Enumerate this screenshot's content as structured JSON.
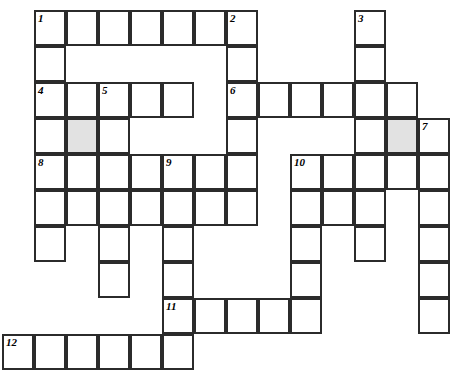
{
  "puzzle": {
    "type": "crossword-grid",
    "title": "Crossword Puzzle Grid",
    "columns": 14,
    "rows": 10,
    "cell_width": 32,
    "cell_height": 36,
    "origin_x": 2,
    "origin_y": 10,
    "colors": {
      "background": "#ffffff",
      "cell_fill": "#ffffff",
      "cell_border": "#2b2b2b",
      "shaded_fill": "#e2e2e2",
      "number_text": "#000000"
    },
    "clue_numbers": [
      1,
      2,
      3,
      4,
      5,
      6,
      7,
      8,
      9,
      10,
      11,
      12
    ],
    "cells": [
      {
        "col": 1,
        "row": 0,
        "number": "1",
        "shaded": false,
        "letter": ""
      },
      {
        "col": 2,
        "row": 0,
        "number": "",
        "shaded": false,
        "letter": ""
      },
      {
        "col": 3,
        "row": 0,
        "number": "",
        "shaded": false,
        "letter": ""
      },
      {
        "col": 4,
        "row": 0,
        "number": "",
        "shaded": false,
        "letter": ""
      },
      {
        "col": 5,
        "row": 0,
        "number": "",
        "shaded": false,
        "letter": ""
      },
      {
        "col": 6,
        "row": 0,
        "number": "",
        "shaded": false,
        "letter": ""
      },
      {
        "col": 7,
        "row": 0,
        "number": "2",
        "shaded": false,
        "letter": ""
      },
      {
        "col": 11,
        "row": 0,
        "number": "3",
        "shaded": false,
        "letter": ""
      },
      {
        "col": 1,
        "row": 1,
        "number": "",
        "shaded": false,
        "letter": ""
      },
      {
        "col": 7,
        "row": 1,
        "number": "",
        "shaded": false,
        "letter": ""
      },
      {
        "col": 11,
        "row": 1,
        "number": "",
        "shaded": false,
        "letter": ""
      },
      {
        "col": 1,
        "row": 2,
        "number": "4",
        "shaded": false,
        "letter": ""
      },
      {
        "col": 2,
        "row": 2,
        "number": "",
        "shaded": false,
        "letter": ""
      },
      {
        "col": 3,
        "row": 2,
        "number": "5",
        "shaded": false,
        "letter": ""
      },
      {
        "col": 4,
        "row": 2,
        "number": "",
        "shaded": false,
        "letter": ""
      },
      {
        "col": 5,
        "row": 2,
        "number": "",
        "shaded": false,
        "letter": ""
      },
      {
        "col": 7,
        "row": 2,
        "number": "6",
        "shaded": false,
        "letter": ""
      },
      {
        "col": 8,
        "row": 2,
        "number": "",
        "shaded": false,
        "letter": ""
      },
      {
        "col": 9,
        "row": 2,
        "number": "",
        "shaded": false,
        "letter": ""
      },
      {
        "col": 10,
        "row": 2,
        "number": "",
        "shaded": false,
        "letter": ""
      },
      {
        "col": 11,
        "row": 2,
        "number": "",
        "shaded": false,
        "letter": ""
      },
      {
        "col": 12,
        "row": 2,
        "number": "",
        "shaded": false,
        "letter": ""
      },
      {
        "col": 1,
        "row": 3,
        "number": "",
        "shaded": false,
        "letter": ""
      },
      {
        "col": 2,
        "row": 3,
        "number": "",
        "shaded": true,
        "letter": ""
      },
      {
        "col": 3,
        "row": 3,
        "number": "",
        "shaded": false,
        "letter": ""
      },
      {
        "col": 7,
        "row": 3,
        "number": "",
        "shaded": false,
        "letter": ""
      },
      {
        "col": 11,
        "row": 3,
        "number": "",
        "shaded": false,
        "letter": ""
      },
      {
        "col": 12,
        "row": 3,
        "number": "",
        "shaded": true,
        "letter": ""
      },
      {
        "col": 13,
        "row": 3,
        "number": "7",
        "shaded": false,
        "letter": ""
      },
      {
        "col": 1,
        "row": 4,
        "number": "8",
        "shaded": false,
        "letter": ""
      },
      {
        "col": 2,
        "row": 4,
        "number": "",
        "shaded": false,
        "letter": ""
      },
      {
        "col": 3,
        "row": 4,
        "number": "",
        "shaded": false,
        "letter": ""
      },
      {
        "col": 4,
        "row": 4,
        "number": "",
        "shaded": false,
        "letter": ""
      },
      {
        "col": 5,
        "row": 4,
        "number": "9",
        "shaded": false,
        "letter": ""
      },
      {
        "col": 6,
        "row": 4,
        "number": "",
        "shaded": false,
        "letter": ""
      },
      {
        "col": 7,
        "row": 4,
        "number": "",
        "shaded": false,
        "letter": ""
      },
      {
        "col": 9,
        "row": 4,
        "number": "10",
        "shaded": false,
        "letter": ""
      },
      {
        "col": 10,
        "row": 4,
        "number": "",
        "shaded": false,
        "letter": ""
      },
      {
        "col": 11,
        "row": 4,
        "number": "",
        "shaded": false,
        "letter": ""
      },
      {
        "col": 12,
        "row": 4,
        "number": "",
        "shaded": false,
        "letter": ""
      },
      {
        "col": 13,
        "row": 4,
        "number": "",
        "shaded": false,
        "letter": ""
      },
      {
        "col": 1,
        "row": 5,
        "number": "",
        "shaded": false,
        "letter": ""
      },
      {
        "col": 2,
        "row": 5,
        "number": "",
        "shaded": false,
        "letter": ""
      },
      {
        "col": 3,
        "row": 5,
        "number": "",
        "shaded": false,
        "letter": ""
      },
      {
        "col": 4,
        "row": 5,
        "number": "",
        "shaded": false,
        "letter": ""
      },
      {
        "col": 5,
        "row": 5,
        "number": "",
        "shaded": false,
        "letter": ""
      },
      {
        "col": 6,
        "row": 5,
        "number": "",
        "shaded": false,
        "letter": ""
      },
      {
        "col": 7,
        "row": 5,
        "number": "",
        "shaded": false,
        "letter": ""
      },
      {
        "col": 9,
        "row": 5,
        "number": "",
        "shaded": false,
        "letter": ""
      },
      {
        "col": 10,
        "row": 5,
        "number": "",
        "shaded": false,
        "letter": ""
      },
      {
        "col": 11,
        "row": 5,
        "number": "",
        "shaded": false,
        "letter": ""
      },
      {
        "col": 13,
        "row": 5,
        "number": "",
        "shaded": false,
        "letter": ""
      },
      {
        "col": 1,
        "row": 6,
        "number": "",
        "shaded": false,
        "letter": ""
      },
      {
        "col": 3,
        "row": 6,
        "number": "",
        "shaded": false,
        "letter": ""
      },
      {
        "col": 5,
        "row": 6,
        "number": "",
        "shaded": false,
        "letter": ""
      },
      {
        "col": 9,
        "row": 6,
        "number": "",
        "shaded": false,
        "letter": ""
      },
      {
        "col": 11,
        "row": 6,
        "number": "",
        "shaded": false,
        "letter": ""
      },
      {
        "col": 13,
        "row": 6,
        "number": "",
        "shaded": false,
        "letter": ""
      },
      {
        "col": 3,
        "row": 7,
        "number": "",
        "shaded": false,
        "letter": ""
      },
      {
        "col": 5,
        "row": 7,
        "number": "",
        "shaded": false,
        "letter": ""
      },
      {
        "col": 9,
        "row": 7,
        "number": "",
        "shaded": false,
        "letter": ""
      },
      {
        "col": 13,
        "row": 7,
        "number": "",
        "shaded": false,
        "letter": ""
      },
      {
        "col": 5,
        "row": 8,
        "number": "11",
        "shaded": false,
        "letter": ""
      },
      {
        "col": 6,
        "row": 8,
        "number": "",
        "shaded": false,
        "letter": ""
      },
      {
        "col": 7,
        "row": 8,
        "number": "",
        "shaded": false,
        "letter": ""
      },
      {
        "col": 8,
        "row": 8,
        "number": "",
        "shaded": false,
        "letter": ""
      },
      {
        "col": 9,
        "row": 8,
        "number": "",
        "shaded": false,
        "letter": ""
      },
      {
        "col": 13,
        "row": 8,
        "number": "",
        "shaded": false,
        "letter": ""
      },
      {
        "col": 0,
        "row": 9,
        "number": "12",
        "shaded": false,
        "letter": ""
      },
      {
        "col": 1,
        "row": 9,
        "number": "",
        "shaded": false,
        "letter": ""
      },
      {
        "col": 2,
        "row": 9,
        "number": "",
        "shaded": false,
        "letter": ""
      },
      {
        "col": 3,
        "row": 9,
        "number": "",
        "shaded": false,
        "letter": ""
      },
      {
        "col": 4,
        "row": 9,
        "number": "",
        "shaded": false,
        "letter": ""
      },
      {
        "col": 5,
        "row": 9,
        "number": "",
        "shaded": false,
        "letter": ""
      }
    ]
  }
}
